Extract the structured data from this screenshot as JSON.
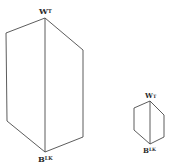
{
  "diagram": {
    "large_prism": {
      "top_label": {
        "main": "W",
        "sup": "T"
      },
      "bottom_label": {
        "main": "B",
        "sup": "LK"
      }
    },
    "small_prism": {
      "top_label": {
        "main": "W",
        "sup": "T"
      },
      "bottom_label": {
        "main": "B",
        "sup": "LK"
      }
    },
    "colors": {
      "line": "#4a4a4a",
      "text": "#2a2a2a",
      "background": "#ffffff"
    }
  }
}
